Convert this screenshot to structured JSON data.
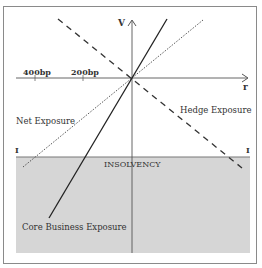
{
  "diagram": {
    "axes": {
      "y_label": "V",
      "x_label": "r",
      "ticks": [
        {
          "label": "400bp",
          "x": 35
        },
        {
          "label": "200bp",
          "x": 83
        }
      ]
    },
    "lines": {
      "net_exposure": {
        "label": "Net Exposure",
        "style": "dotted"
      },
      "hedge_exposure": {
        "label": "Hedge Exposure",
        "style": "dashed"
      },
      "core_business_exposure": {
        "label": "Core Business Exposure",
        "style": "solid"
      }
    },
    "insolvency": {
      "label": "INSOLVENCY",
      "marker_left": "I",
      "marker_right": "I",
      "fill_color": "#d6d6d6"
    },
    "colors": {
      "line": "#333333",
      "axis": "#555555",
      "border": "#8a8a8a"
    }
  }
}
